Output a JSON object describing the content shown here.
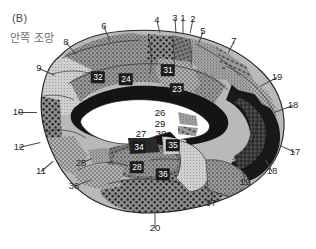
{
  "figure": {
    "panel_letter": "(B)",
    "view_caption": "안쪽 조망",
    "colors": {
      "background": "#ffffff",
      "outline": "#2b2b2b",
      "label_text": "#2b2b2b",
      "caption_text": "#6a6a6a",
      "boxed_label_bg": "#1c1c1c",
      "boxed_label_text": "#ffffff",
      "callosum_white": "#ffffff",
      "dark_region": "#1e1e1e"
    }
  },
  "labels": {
    "outer": [
      {
        "id": "area-6",
        "text": "6",
        "x": 104,
        "y": 26,
        "leader": {
          "x2": 110,
          "y2": 41
        }
      },
      {
        "id": "area-4",
        "text": "4",
        "x": 157,
        "y": 20,
        "leader": {
          "x2": 160,
          "y2": 33
        }
      },
      {
        "id": "area-3",
        "text": "3",
        "x": 175,
        "y": 18,
        "leader": {
          "x2": 176,
          "y2": 33
        }
      },
      {
        "id": "area-1",
        "text": "1",
        "x": 183,
        "y": 18,
        "leader": {
          "x2": 183,
          "y2": 33
        }
      },
      {
        "id": "area-2",
        "text": "2",
        "x": 193,
        "y": 19,
        "leader": {
          "x2": 190,
          "y2": 33
        }
      },
      {
        "id": "area-5",
        "text": "5",
        "x": 203,
        "y": 31,
        "leader": {
          "x2": 199,
          "y2": 42
        }
      },
      {
        "id": "area-7",
        "text": "7",
        "x": 234,
        "y": 41,
        "leader": {
          "x2": 228,
          "y2": 53
        }
      },
      {
        "id": "area-8",
        "text": "8",
        "x": 66,
        "y": 42,
        "leader": {
          "x2": 76,
          "y2": 54
        }
      },
      {
        "id": "area-9",
        "text": "9",
        "x": 39,
        "y": 68,
        "leader": {
          "x2": 55,
          "y2": 75
        }
      },
      {
        "id": "area-10",
        "text": "10",
        "x": 18,
        "y": 112,
        "leader": {
          "x2": 37,
          "y2": 112
        }
      },
      {
        "id": "area-12",
        "text": "12",
        "x": 19,
        "y": 147,
        "leader": {
          "x2": 40,
          "y2": 142
        }
      },
      {
        "id": "area-11",
        "text": "11",
        "x": 41,
        "y": 171,
        "leader": {
          "x2": 53,
          "y2": 161
        }
      },
      {
        "id": "area-38",
        "text": "38",
        "x": 74,
        "y": 186,
        "leader": {
          "x2": 92,
          "y2": 179
        }
      },
      {
        "id": "area-25",
        "text": "25",
        "x": 81,
        "y": 163,
        "leader": {
          "x2": 92,
          "y2": 158
        }
      },
      {
        "id": "area-20",
        "text": "20",
        "x": 155,
        "y": 228,
        "leader": {
          "x2": 155,
          "y2": 210
        }
      },
      {
        "id": "area-37",
        "text": "37",
        "x": 211,
        "y": 203,
        "leader": {
          "x2": 213,
          "y2": 191
        }
      },
      {
        "id": "area-19-lower",
        "text": "19",
        "x": 245,
        "y": 182,
        "leader": {
          "x2": 243,
          "y2": 171
        }
      },
      {
        "id": "area-18-lower",
        "text": "18",
        "x": 272,
        "y": 171,
        "leader": {
          "x2": 266,
          "y2": 160
        }
      },
      {
        "id": "area-17",
        "text": "17",
        "x": 295,
        "y": 152,
        "leader": {
          "x2": 278,
          "y2": 144
        }
      },
      {
        "id": "area-18-upper",
        "text": "18",
        "x": 293,
        "y": 105,
        "leader": {
          "x2": 274,
          "y2": 112
        }
      },
      {
        "id": "area-19-upper",
        "text": "19",
        "x": 277,
        "y": 77,
        "leader": {
          "x2": 260,
          "y2": 86
        }
      }
    ],
    "inner_plain": [
      {
        "id": "area-33",
        "text": "33",
        "x": 101,
        "y": 97
      },
      {
        "id": "area-26",
        "text": "26",
        "x": 160,
        "y": 113
      },
      {
        "id": "area-29",
        "text": "29",
        "x": 160,
        "y": 124
      },
      {
        "id": "area-30",
        "text": "30",
        "x": 161,
        "y": 134
      },
      {
        "id": "area-27",
        "text": "27",
        "x": 141,
        "y": 134
      }
    ],
    "boxed": [
      {
        "id": "area-32",
        "text": "32",
        "x": 98,
        "y": 77
      },
      {
        "id": "area-24",
        "text": "24",
        "x": 126,
        "y": 79
      },
      {
        "id": "area-31",
        "text": "31",
        "x": 168,
        "y": 70
      },
      {
        "id": "area-23",
        "text": "23",
        "x": 177,
        "y": 89
      },
      {
        "id": "area-34",
        "text": "34",
        "x": 139,
        "y": 147
      },
      {
        "id": "area-35",
        "text": "35",
        "x": 173,
        "y": 145
      },
      {
        "id": "area-28",
        "text": "28",
        "x": 137,
        "y": 167
      },
      {
        "id": "area-36",
        "text": "36",
        "x": 163,
        "y": 174
      }
    ]
  }
}
